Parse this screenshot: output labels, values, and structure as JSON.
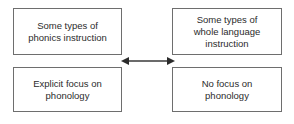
{
  "diagram": {
    "type": "relationship-diagram",
    "background_color": "#ffffff",
    "box_border_color": "#6e6e6e",
    "text_color": "#2b2b2b",
    "arrow_color": "#3a3a3a",
    "boxes": [
      {
        "id": "phonics-instruction",
        "position": "top-left",
        "label": "Some types of\nphonics instruction"
      },
      {
        "id": "whole-language-instruction",
        "position": "top-right",
        "label": "Some types of\nwhole language\ninstruction"
      },
      {
        "id": "explicit-phonology",
        "position": "bottom-left",
        "label": "Explicit focus on\nphonology"
      },
      {
        "id": "no-phonology",
        "position": "bottom-right",
        "label": "No focus on\nphonology"
      }
    ],
    "connector": {
      "id": "double-headed-arrow",
      "style": "double-headed-horizontal",
      "from": "phonics-instruction",
      "to": "whole-language-instruction",
      "label": ""
    }
  }
}
